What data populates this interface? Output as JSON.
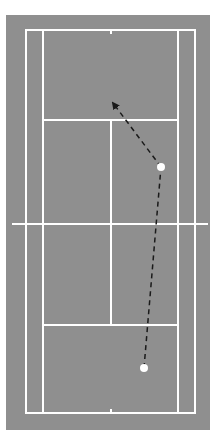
{
  "diagram": {
    "type": "badminton-court-shot-path",
    "colors": {
      "background": "#ffffff",
      "court": "#8f8f8f",
      "lines": "#ffffff",
      "path": "#1a1a1a",
      "player": "#ffffff"
    },
    "court": {
      "outer": {
        "x": 6,
        "y": 15,
        "w": 204,
        "h": 415
      },
      "baseline_top_y": 30,
      "baseline_bottom_y": 413,
      "doubles_left_x": 26,
      "doubles_right_x": 195,
      "singles_left_x": 43,
      "singles_right_x": 178,
      "center_x": 111,
      "short_service_top_y": 120,
      "short_service_bottom_y": 325,
      "net": {
        "y": 224,
        "x1": 12,
        "x2": 208
      }
    },
    "players": [
      {
        "id": "start",
        "x": 144,
        "y": 368,
        "r": 4
      },
      {
        "id": "hit",
        "x": 161,
        "y": 167,
        "r": 4
      }
    ],
    "paths": [
      {
        "from": [
          144,
          368
        ],
        "to": [
          161,
          167
        ],
        "arrow": false
      },
      {
        "from": [
          161,
          167
        ],
        "to": [
          111,
          100
        ],
        "arrow": true
      }
    ]
  }
}
